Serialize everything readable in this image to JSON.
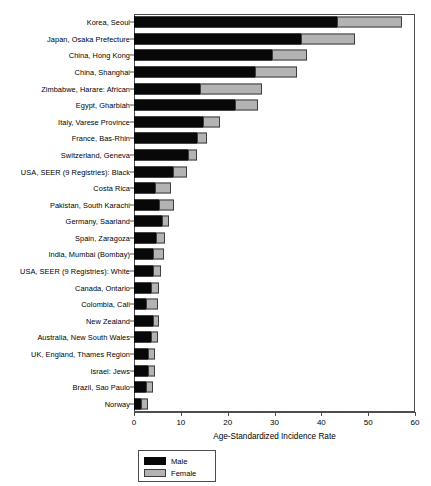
{
  "chart_data": {
    "type": "bar",
    "orientation": "horizontal",
    "stacked": true,
    "title": "",
    "xlabel": "Age-Standardized Incidence Rate",
    "ylabel": "",
    "xlim": [
      0,
      60
    ],
    "xticks": [
      0,
      10,
      20,
      30,
      40,
      50,
      60
    ],
    "grid": false,
    "legend_position": "below-left",
    "categories": [
      "Korea, Seoul",
      "Japan, Osaka Prefecture",
      "China, Hong Kong",
      "China, Shanghai",
      "Zimbabwe, Harare: African",
      "Egypt, Gharbiah",
      "Italy, Varese Province",
      "France, Bas-Rhin",
      "Switzerland, Geneva",
      "USA, SEER (9 Registries): Black",
      "Costa Rica",
      "Pakistan, South Karachi",
      "Germany, Saarland",
      "Spain, Zaragoza",
      "India, Mumbai (Bombay)",
      "USA, SEER (9 Registries): White",
      "Canada, Ontario",
      "Colombia, Cali",
      "New Zealand",
      "Australia, New South Wales",
      "UK, England, Thames Region",
      "Israel: Jews",
      "Brazil, Sao Paulo",
      "Norway"
    ],
    "series": [
      {
        "name": "Male",
        "color": "#080808",
        "values": [
          43.4,
          35.7,
          29.5,
          25.9,
          14.1,
          21.6,
          14.7,
          13.4,
          11.6,
          8.4,
          4.5,
          5.3,
          6.0,
          4.7,
          4.0,
          4.0,
          3.6,
          2.6,
          4.0,
          3.6,
          3.0,
          3.0,
          2.6,
          1.6
        ]
      },
      {
        "name": "Female",
        "color": "#b3b3b3",
        "values": [
          13.9,
          11.5,
          7.5,
          8.9,
          13.3,
          4.9,
          3.7,
          2.2,
          1.9,
          2.9,
          3.4,
          3.2,
          1.5,
          1.9,
          2.4,
          1.8,
          1.7,
          2.5,
          1.3,
          1.5,
          1.5,
          1.4,
          1.4,
          1.4
        ]
      }
    ],
    "totals": [
      57.3,
      47.2,
      37.0,
      34.8,
      27.4,
      26.5,
      18.4,
      15.6,
      13.5,
      11.3,
      7.9,
      8.5,
      7.5,
      6.6,
      6.4,
      5.8,
      5.3,
      5.1,
      5.3,
      5.1,
      4.5,
      4.4,
      4.0,
      3.0
    ]
  },
  "legend": {
    "entries": [
      {
        "label": "Male",
        "color": "#080808"
      },
      {
        "label": "Female",
        "color": "#b3b3b3"
      }
    ]
  },
  "axis": {
    "x_title": "Age-Standardized Incidence Rate",
    "x_tick_labels": [
      "0",
      "10",
      "20",
      "30",
      "40",
      "50",
      "60"
    ]
  }
}
